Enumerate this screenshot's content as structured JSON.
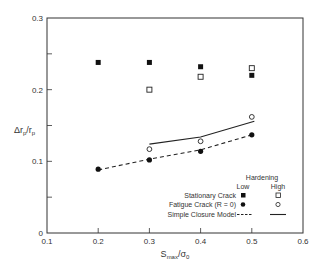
{
  "chart_data": {
    "type": "scatter",
    "title": "",
    "xlabel": "S_max/σ_0",
    "ylabel": "Δr_p/r_p",
    "xlim": [
      0.1,
      0.6
    ],
    "ylim": [
      0,
      0.3
    ],
    "x_ticks": [
      "0.1",
      "0.2",
      "0.3",
      "0.4",
      "0.5",
      "0.6"
    ],
    "y_ticks": [
      "0",
      "0.1",
      "0.2",
      "0.3"
    ],
    "grid": false,
    "legend_position": "lower right",
    "legend": {
      "header": "Hardening",
      "columns": [
        "Low",
        "High"
      ],
      "rows": [
        "Stationary Crack",
        "Fatigue Crack (R = 0)",
        "Simple Closure Model"
      ]
    },
    "series": [
      {
        "name": "Stationary Crack - Low Hardening",
        "marker": "filled-square",
        "x": [
          0.2,
          0.3,
          0.4,
          0.5
        ],
        "y": [
          0.238,
          0.238,
          0.232,
          0.22
        ]
      },
      {
        "name": "Stationary Crack - High Hardening",
        "marker": "open-square",
        "x": [
          0.3,
          0.4,
          0.5
        ],
        "y": [
          0.2,
          0.218,
          0.23
        ]
      },
      {
        "name": "Fatigue Crack (R = 0) - Low Hardening",
        "marker": "filled-circle",
        "x": [
          0.2,
          0.3,
          0.4,
          0.5
        ],
        "y": [
          0.089,
          0.102,
          0.114,
          0.137
        ]
      },
      {
        "name": "Fatigue Crack (R = 0) - High Hardening",
        "marker": "open-circle",
        "x": [
          0.3,
          0.4,
          0.5
        ],
        "y": [
          0.117,
          0.128,
          0.162
        ]
      },
      {
        "name": "Simple Closure Model - Low Hardening",
        "line": "dashed",
        "x": [
          0.2,
          0.3,
          0.4,
          0.505
        ],
        "y": [
          0.088,
          0.103,
          0.116,
          0.138
        ]
      },
      {
        "name": "Simple Closure Model - High Hardening",
        "line": "solid",
        "x": [
          0.3,
          0.4,
          0.505
        ],
        "y": [
          0.124,
          0.134,
          0.156
        ]
      }
    ]
  }
}
